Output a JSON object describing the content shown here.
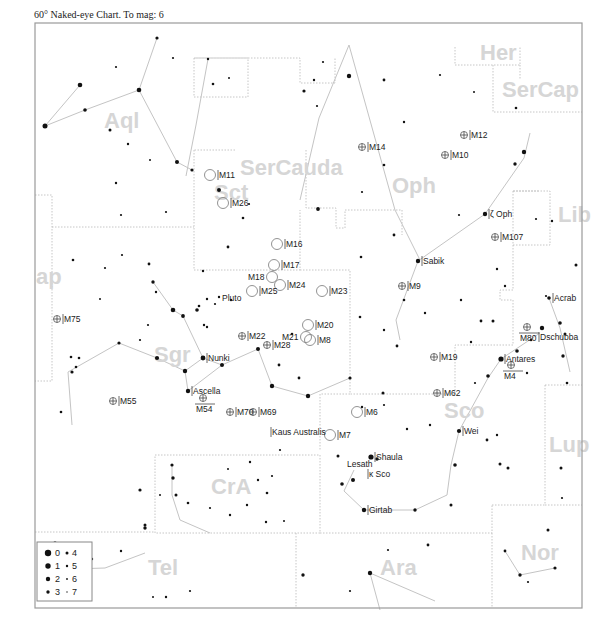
{
  "header": {
    "title": "60° Naked-eye Chart. To mag: 6"
  },
  "chart": {
    "frame": {
      "x": 35,
      "y": 23,
      "w": 547,
      "h": 585
    },
    "constellation_labels": [
      {
        "text": "Her",
        "x": 480,
        "y": 60
      },
      {
        "text": "SerCap",
        "x": 502,
        "y": 97
      },
      {
        "text": "Aql",
        "x": 104,
        "y": 128
      },
      {
        "text": "SerCauda",
        "x": 240,
        "y": 175
      },
      {
        "text": "Sct",
        "x": 214,
        "y": 200
      },
      {
        "text": "Oph",
        "x": 392,
        "y": 193
      },
      {
        "text": "Lib",
        "x": 558,
        "y": 222
      },
      {
        "text": "ap",
        "x": 36,
        "y": 284
      },
      {
        "text": "Sgr",
        "x": 154,
        "y": 362
      },
      {
        "text": "Sco",
        "x": 444,
        "y": 418
      },
      {
        "text": "Lup",
        "x": 549,
        "y": 452
      },
      {
        "text": "CrA",
        "x": 211,
        "y": 494
      },
      {
        "text": "Tel",
        "x": 148,
        "y": 575
      },
      {
        "text": "Ara",
        "x": 380,
        "y": 575
      },
      {
        "text": "Nor",
        "x": 521,
        "y": 560
      }
    ],
    "named_stars": [
      {
        "name": "Sabik",
        "x": 418,
        "y": 261
      },
      {
        "name": "ζ Oph",
        "x": 485,
        "y": 214
      },
      {
        "name": "Acrab",
        "x": 549,
        "y": 298
      },
      {
        "name": "Dschubba",
        "x": 538,
        "y": 337
      },
      {
        "name": "Antares",
        "x": 501,
        "y": 359
      },
      {
        "name": "Nunki",
        "x": 203,
        "y": 358
      },
      {
        "name": "Ascella",
        "x": 188,
        "y": 391
      },
      {
        "name": "Kaus Australis",
        "x": 267,
        "y": 432
      },
      {
        "name": "Wei",
        "x": 459,
        "y": 431
      },
      {
        "name": "Shaula",
        "x": 371,
        "y": 457
      },
      {
        "name": "Lesath",
        "x": 375,
        "y": 458
      },
      {
        "name": "κ Sco",
        "x": 364,
        "y": 474
      },
      {
        "name": "Girtab",
        "x": 364,
        "y": 510
      },
      {
        "name": "Pluto",
        "x": 246,
        "y": 298
      }
    ],
    "deep_sky": [
      {
        "name": "M11",
        "x": 210,
        "y": 175,
        "type": "open"
      },
      {
        "name": "M26",
        "x": 223,
        "y": 203,
        "type": "open"
      },
      {
        "name": "M16",
        "x": 277,
        "y": 244,
        "type": "open"
      },
      {
        "name": "M17",
        "x": 274,
        "y": 265,
        "type": "open"
      },
      {
        "name": "M18",
        "x": 272,
        "y": 277,
        "type": "open"
      },
      {
        "name": "M24",
        "x": 280,
        "y": 285,
        "type": "open"
      },
      {
        "name": "M25",
        "x": 252,
        "y": 291,
        "type": "open"
      },
      {
        "name": "M23",
        "x": 322,
        "y": 291,
        "type": "open"
      },
      {
        "name": "M20",
        "x": 308,
        "y": 325,
        "type": "open"
      },
      {
        "name": "M21",
        "x": 306,
        "y": 337,
        "type": "open"
      },
      {
        "name": "M8",
        "x": 310,
        "y": 340,
        "type": "open"
      },
      {
        "name": "M6",
        "x": 357,
        "y": 412,
        "type": "open"
      },
      {
        "name": "M7",
        "x": 330,
        "y": 435,
        "type": "open"
      },
      {
        "name": "M14",
        "x": 362,
        "y": 147,
        "type": "glob"
      },
      {
        "name": "M12",
        "x": 464,
        "y": 135,
        "type": "glob"
      },
      {
        "name": "M10",
        "x": 445,
        "y": 155,
        "type": "glob"
      },
      {
        "name": "M107",
        "x": 495,
        "y": 237,
        "type": "glob"
      },
      {
        "name": "M9",
        "x": 402,
        "y": 286,
        "type": "glob"
      },
      {
        "name": "M75",
        "x": 57,
        "y": 319,
        "type": "glob"
      },
      {
        "name": "M22",
        "x": 242,
        "y": 336,
        "type": "glob"
      },
      {
        "name": "M28",
        "x": 267,
        "y": 345,
        "type": "glob"
      },
      {
        "name": "M19",
        "x": 434,
        "y": 357,
        "type": "glob"
      },
      {
        "name": "M80",
        "x": 527,
        "y": 327,
        "type": "glob"
      },
      {
        "name": "M4",
        "x": 511,
        "y": 365,
        "type": "glob"
      },
      {
        "name": "M62",
        "x": 437,
        "y": 393,
        "type": "glob"
      },
      {
        "name": "M55",
        "x": 113,
        "y": 401,
        "type": "glob"
      },
      {
        "name": "M54",
        "x": 203,
        "y": 398,
        "type": "glob"
      },
      {
        "name": "M70",
        "x": 230,
        "y": 412,
        "type": "glob"
      },
      {
        "name": "M69",
        "x": 253,
        "y": 412,
        "type": "glob"
      }
    ],
    "legend": {
      "rows": [
        {
          "a": "0",
          "b": "4"
        },
        {
          "a": "1",
          "b": "5"
        },
        {
          "a": "2",
          "b": "6"
        },
        {
          "a": "3",
          "b": "7"
        }
      ]
    }
  }
}
